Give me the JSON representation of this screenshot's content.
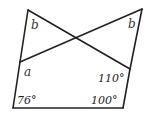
{
  "diagram": {
    "type": "geometry-angles",
    "stroke_color": "#222222",
    "vertices": {
      "top_left": [
        28,
        10
      ],
      "top_right": [
        142,
        9
      ],
      "left_junction": [
        20,
        62
      ],
      "right_junction": [
        130,
        69
      ],
      "bottom_left": [
        13,
        108
      ],
      "bottom_right": [
        123,
        108
      ]
    },
    "labels": {
      "b_left": "b",
      "b_right": "b",
      "a": "a",
      "angle_110": "110°",
      "angle_76": "76°",
      "angle_100": "100°"
    }
  }
}
